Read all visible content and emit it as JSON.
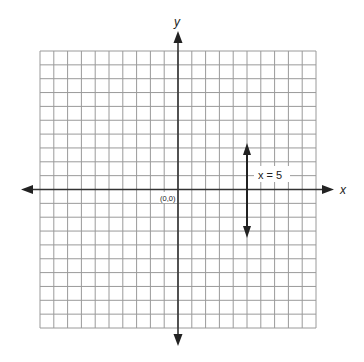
{
  "diagram": {
    "type": "coordinate-plane",
    "grid": {
      "columns": 20,
      "rows": 20,
      "x_range": [
        -10,
        10
      ],
      "y_range": [
        -10,
        10
      ],
      "line_color": "#9a9a9a",
      "axis_color": "#333333"
    },
    "axes": {
      "x_label": "x",
      "y_label": "y",
      "origin_label": "(0,0)"
    },
    "lines": [
      {
        "equation_label": "x = 5",
        "type": "vertical",
        "x": 5,
        "y_from": 3.3,
        "y_to": -3.5
      }
    ]
  }
}
